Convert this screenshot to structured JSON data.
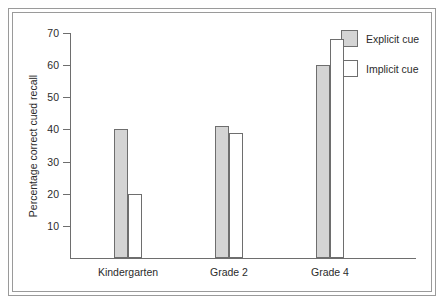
{
  "chart_data": {
    "type": "bar",
    "title": "",
    "xlabel": "",
    "ylabel": "Percentage correct cued recall",
    "categories": [
      "Kindergarten",
      "Grade 2",
      "Grade 4"
    ],
    "series": [
      {
        "name": "Explicit cue",
        "values": [
          40,
          41,
          60
        ],
        "color": "#d4d4d4"
      },
      {
        "name": "Implicit cue",
        "values": [
          20,
          39,
          68
        ],
        "color": "#ffffff"
      }
    ],
    "ylim": [
      0,
      70
    ],
    "ytick_step": 10,
    "yticks": [
      70,
      60,
      50,
      40,
      30,
      20,
      10
    ],
    "ytick_labels": [
      "70",
      "60",
      "50",
      "40",
      "30",
      "20",
      "10"
    ],
    "grid": false,
    "legend_position": "top-right",
    "axis_color": "#6e6e6e",
    "bar_edge_color": "#6e6e6e",
    "frame_color": "#9a9a9a",
    "text_color": "#2b2b2b",
    "background": "#ffffff"
  },
  "legend": {
    "entries": [
      {
        "label": "Explicit cue",
        "swatch": "explicit"
      },
      {
        "label": "Implicit cue",
        "swatch": "implicit"
      }
    ]
  }
}
